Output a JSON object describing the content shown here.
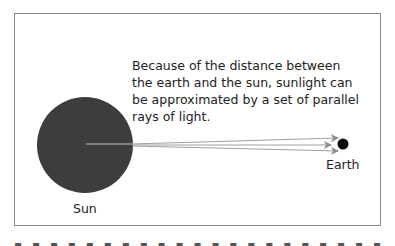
{
  "diagram": {
    "caption_lines": [
      "Because of the distance between",
      "the earth and the sun, sunlight can",
      "be approximated by a set of parallel",
      "rays of light."
    ],
    "sun_label": "Sun",
    "earth_label": "Earth",
    "colors": {
      "sun": "#3d3d3d",
      "earth": "#0a0a0a",
      "rays": "#9a9a9a",
      "border": "#8a8a8a"
    }
  }
}
